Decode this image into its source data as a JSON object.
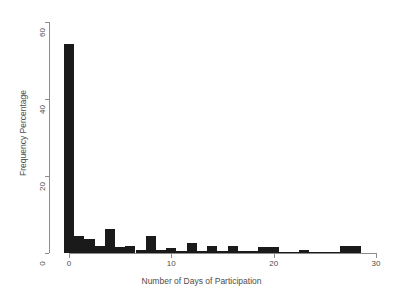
{
  "chart_data": {
    "type": "bar",
    "title": "",
    "subtitle": "",
    "xlabel": "Number of Days of Participation",
    "ylabel": "Frequency Percentage",
    "xlim": [
      -1,
      31
    ],
    "ylim": [
      0,
      62
    ],
    "xticks": [
      0,
      10,
      20,
      30
    ],
    "yticks": [
      0,
      20,
      40,
      60
    ],
    "xtick_labels": [
      "0",
      "10",
      "20",
      "30"
    ],
    "ytick_labels": [
      "0",
      "20",
      "40",
      "60"
    ],
    "grid": false,
    "legend": null,
    "bar_color": "#1a1a1a",
    "axis_color": "#8c8c8c",
    "bin_width": 1,
    "categories": [
      0,
      1,
      2,
      3,
      4,
      5,
      6,
      7,
      8,
      9,
      10,
      11,
      12,
      13,
      14,
      15,
      16,
      17,
      18,
      19,
      20,
      21,
      22,
      23,
      24,
      25,
      26,
      27,
      28
    ],
    "values": [
      54.3,
      4.4,
      3.6,
      1.8,
      6.2,
      1.6,
      1.7,
      0.7,
      4.5,
      0.9,
      1.2,
      0.6,
      2.6,
      0.5,
      1.8,
      0.5,
      1.7,
      0.6,
      0.5,
      1.6,
      1.5,
      0.3,
      0.3,
      0.9,
      0.3,
      0.2,
      0.2,
      1.7,
      1.7
    ]
  },
  "figure": {
    "background_color": "#ffffff"
  }
}
